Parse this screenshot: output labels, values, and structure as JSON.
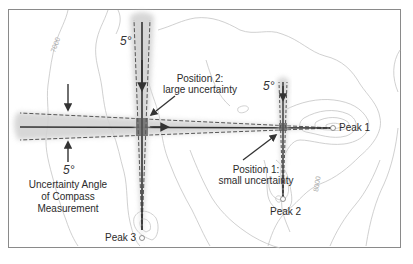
{
  "diagram": {
    "contour_labels": [
      "7000",
      "8000"
    ],
    "angle_labels": {
      "left": "5°",
      "position2": "5°",
      "position1": "5°"
    },
    "uncertainty_caption": [
      "Uncertainty Angle",
      "of Compass",
      "Measurement"
    ],
    "position2": [
      "Position 2:",
      "large uncertainty"
    ],
    "position1": [
      "Position 1:",
      "small uncertainty"
    ],
    "peaks": {
      "peak1": "Peak 1",
      "peak2": "Peak 2",
      "peak3": "Peak 3"
    },
    "colors": {
      "contour": "#bdbdbd",
      "bearing_line": "#3a3a3a",
      "uncertainty_band": "#cfcfcf",
      "dashed": "#555555",
      "frame": "#8a8a8a"
    }
  }
}
